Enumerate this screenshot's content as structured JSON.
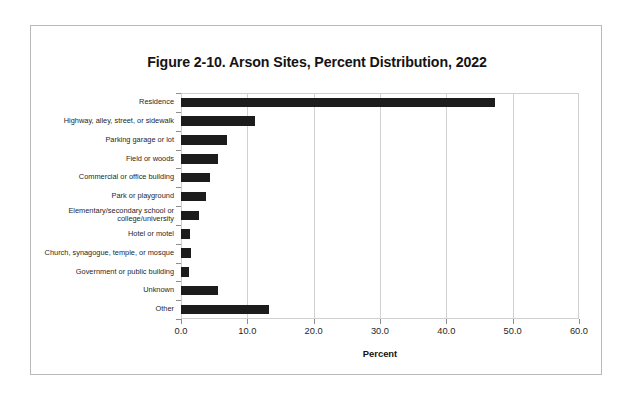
{
  "figure": {
    "title": "Figure 2-10. Arson Sites, Percent Distribution, 2022",
    "xaxis_title": "Percent"
  },
  "chart_data": {
    "type": "bar",
    "orientation": "horizontal",
    "title": "Figure 2-10. Arson Sites, Percent Distribution, 2022",
    "xlabel": "Percent",
    "ylabel": "",
    "xlim": [
      0.0,
      60.0
    ],
    "xticks": [
      "0.0",
      "10.0",
      "20.0",
      "30.0",
      "40.0",
      "50.0",
      "60.0"
    ],
    "xtick_values": [
      0,
      10,
      20,
      30,
      40,
      50,
      60
    ],
    "grid": "vertical",
    "legend": "none",
    "bar_color": "#1c1c1c",
    "categories": [
      "Residence",
      "Highway, alley, street, or sidewalk",
      "Parking garage or lot",
      "Field or woods",
      "Commercial or office building",
      "Park or playground",
      "Elementary/secondary school or college/university",
      "Hotel or motel",
      "Church, synagogue, temple, or mosque",
      "Government or public building",
      "Unknown",
      "Other"
    ],
    "category_lines": [
      [
        "Residence"
      ],
      [
        "Highway, alley, street, or sidewalk"
      ],
      [
        "Parking garage or lot"
      ],
      [
        "Field or woods"
      ],
      [
        "Commercial or office building"
      ],
      [
        "Park or playground"
      ],
      [
        "Elementary/secondary school or",
        "college/university"
      ],
      [
        "Hotel or motel"
      ],
      [
        "Church, synagogue, temple, or mosque"
      ],
      [
        "Government or public building"
      ],
      [
        "Unknown"
      ],
      [
        "Other"
      ]
    ],
    "values": [
      47.3,
      11.1,
      6.9,
      5.6,
      4.4,
      3.8,
      2.7,
      1.4,
      1.5,
      1.2,
      5.6,
      13.2
    ]
  }
}
